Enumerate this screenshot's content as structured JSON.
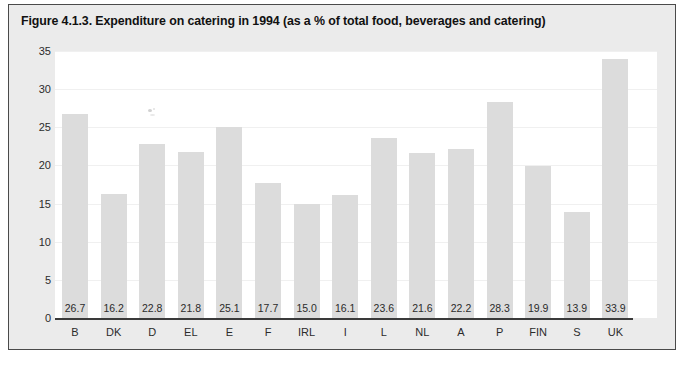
{
  "figure": {
    "title": "Figure 4.1.3. Expenditure on catering in 1994 (as a % of total food, beverages and catering)",
    "frame_background": "#ebebeb",
    "plot_background": "#ffffff",
    "bar_color": "#dcdcdc",
    "axis_color": "#3a3a3a",
    "text_color": "#2b2b2b"
  },
  "chart_data": {
    "type": "bar",
    "title": "Figure 4.1.3. Expenditure on catering in 1994 (as a % of total food, beverages and catering)",
    "xlabel": "",
    "ylabel": "",
    "ylim": [
      0,
      35
    ],
    "yticks": [
      0,
      5,
      10,
      15,
      20,
      25,
      30,
      35
    ],
    "ytick_labels": [
      "0",
      "5",
      "10",
      "15",
      "20",
      "25",
      "30",
      "35"
    ],
    "grid": true,
    "legend": null,
    "categories": [
      "B",
      "DK",
      "D",
      "EL",
      "E",
      "F",
      "IRL",
      "I",
      "L",
      "NL",
      "A",
      "P",
      "FIN",
      "S",
      "UK"
    ],
    "values": [
      26.7,
      16.2,
      22.8,
      21.8,
      25.1,
      17.7,
      15.0,
      16.1,
      23.6,
      21.6,
      22.2,
      28.3,
      19.9,
      13.9,
      33.9
    ],
    "value_labels": [
      "26.7",
      "16.2",
      "22.8",
      "21.8",
      "25.1",
      "17.7",
      "15.0",
      "16.1",
      "23.6",
      "21.6",
      "22.2",
      "28.3",
      "19.9",
      "13.9",
      "33.9"
    ],
    "value_label_position": "inside-bottom"
  }
}
